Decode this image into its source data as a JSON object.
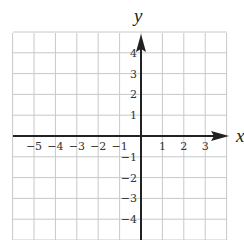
{
  "figure": {
    "type": "coordinate-plane",
    "x_axis_label": "x",
    "y_axis_label": "y",
    "x_ticks": [
      {
        "value": -5,
        "label": "−5"
      },
      {
        "value": -4,
        "label": "−4"
      },
      {
        "value": -3,
        "label": "−3"
      },
      {
        "value": -2,
        "label": "−2"
      },
      {
        "value": -1,
        "label": "−1"
      },
      {
        "value": 1,
        "label": "1"
      },
      {
        "value": 2,
        "label": "2"
      },
      {
        "value": 3,
        "label": "3"
      }
    ],
    "y_ticks": [
      {
        "value": 4,
        "label": "4"
      },
      {
        "value": 3,
        "label": "3"
      },
      {
        "value": 2,
        "label": "2"
      },
      {
        "value": 1,
        "label": "1"
      },
      {
        "value": -1,
        "label": "−1"
      },
      {
        "value": -2,
        "label": "−2"
      },
      {
        "value": -3,
        "label": "−3"
      },
      {
        "value": -4,
        "label": "−4"
      }
    ],
    "x_range": [
      -6,
      4
    ],
    "y_range": [
      -5,
      5
    ],
    "grid": true,
    "colors": {
      "grid": "#c8c8c8",
      "axis": "#222222",
      "background": "#ffffff"
    }
  }
}
